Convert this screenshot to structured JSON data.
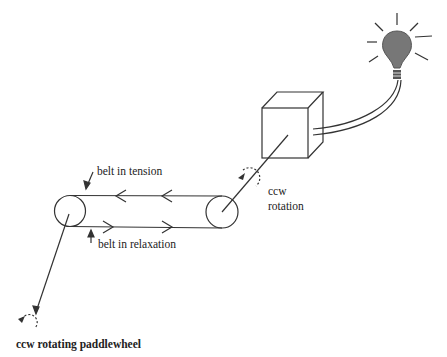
{
  "diagram": {
    "labels": {
      "belt_tension": "belt in tension",
      "belt_relaxation": "belt in relaxation",
      "ccw_line1": "ccw",
      "ccw_line2": "rotation",
      "paddlewheel": "ccw rotating paddlewheel"
    },
    "components": [
      "paddlewheel",
      "belt",
      "drive pulley",
      "generator box",
      "wires",
      "light bulb"
    ],
    "colors": {
      "stroke": "#333333",
      "bulb": "#666666"
    }
  }
}
